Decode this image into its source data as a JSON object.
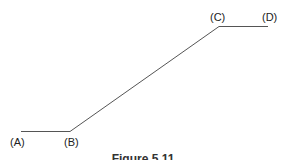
{
  "diagram": {
    "type": "piecewise-line",
    "stroke_color": "#555555",
    "points": [
      {
        "id": "A",
        "label": "(A)",
        "x": 21,
        "y": 131
      },
      {
        "id": "B",
        "label": "(B)",
        "x": 70,
        "y": 131
      },
      {
        "id": "C",
        "label": "(C)",
        "x": 219,
        "y": 26
      },
      {
        "id": "D",
        "label": "(D)",
        "x": 268,
        "y": 26
      }
    ],
    "segments": [
      {
        "from": "A",
        "to": "B",
        "kind": "horizontal"
      },
      {
        "from": "B",
        "to": "C",
        "kind": "rising"
      },
      {
        "from": "C",
        "to": "D",
        "kind": "horizontal"
      }
    ]
  },
  "labels": {
    "a": "(A)",
    "b": "(B)",
    "c": "(C)",
    "d": "(D)"
  },
  "caption": "Figure 5.11"
}
